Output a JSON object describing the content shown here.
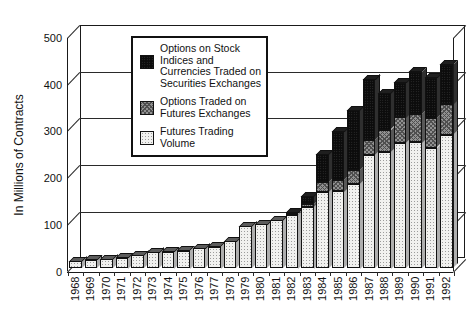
{
  "figure": {
    "background": "#ffffff",
    "text_color": "#111111",
    "axis_color": "#2a2a2a"
  },
  "chart_data": {
    "type": "bar",
    "subtype": "stacked-3d",
    "title": "",
    "xlabel": "",
    "ylabel": "In Millions of Contracts",
    "ylim": [
      0,
      500
    ],
    "yticks": [
      0,
      100,
      200,
      300,
      400,
      500
    ],
    "grid": "horizontal",
    "legend_position": "top-center-inside",
    "categories": [
      "1968",
      "1969",
      "1970",
      "1971",
      "1972",
      "1973",
      "1974",
      "1975",
      "1976",
      "1977",
      "1978",
      "1979",
      "1980",
      "1981",
      "1982",
      "1983",
      "1984",
      "1985",
      "1986",
      "1987",
      "1988",
      "1989",
      "1990",
      "1991",
      "1992"
    ],
    "series": [
      {
        "key": "futures",
        "name": "Futures Trading Volume",
        "values": [
          15,
          18,
          20,
          23,
          28,
          35,
          36,
          38,
          43,
          47,
          58,
          90,
          95,
          103,
          115,
          132,
          163,
          165,
          182,
          243,
          250,
          268,
          270,
          259,
          286
        ]
      },
      {
        "key": "options_on_futures",
        "name": "Options Traded on Futures Exchanges",
        "values": [
          0,
          0,
          0,
          0,
          0,
          0,
          0,
          0,
          0,
          0,
          0,
          0,
          0,
          0,
          2,
          6,
          22,
          25,
          29,
          32,
          47,
          56,
          62,
          63,
          66
        ]
      },
      {
        "key": "securities_options",
        "name": "Options on Stock Indices and Currencies Traded on Securities Exchanges",
        "values": [
          0,
          0,
          0,
          0,
          0,
          0,
          0,
          0,
          0,
          0,
          0,
          0,
          0,
          0,
          3,
          17,
          60,
          103,
          128,
          130,
          78,
          74,
          90,
          86,
          85
        ]
      }
    ],
    "legend_order": [
      "securities_options",
      "options_on_futures",
      "futures"
    ],
    "colors": {
      "futures": {
        "face": "#f1f1ef",
        "side": "#aeaeae",
        "cap": "#5c5c5c"
      },
      "options_on_futures": {
        "face": "#919191",
        "side": "#575757",
        "cap": "#474747"
      },
      "securities_options": {
        "face": "#0c0c0c",
        "side": "#2f2f2f",
        "cap": "#1f1f1f"
      }
    }
  }
}
